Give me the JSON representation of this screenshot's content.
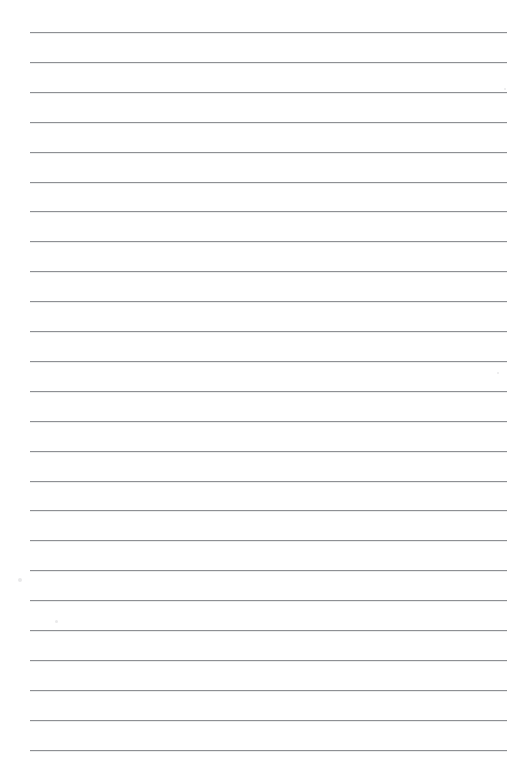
{
  "document": {
    "kind": "lined-paper-sheet",
    "title": "Blank ruled notebook page",
    "page_width_px": 513,
    "page_height_px": 757,
    "background_color": "#ffffff",
    "text_content": "",
    "header_text": "",
    "footer_text": "",
    "page_number": ""
  },
  "ruling": {
    "line_color": "#8e9094",
    "line_thickness_px": 1,
    "line_count": 25,
    "left_margin_px": 30,
    "right_edge_px": 507,
    "line_length_px": 477,
    "first_line_y_px": 32,
    "line_spacing_px": 29.9,
    "margin_rule": "none",
    "lines_y_px": [
      32,
      61.9,
      91.8,
      121.7,
      151.6,
      181.5,
      211.4,
      241.3,
      271.2,
      301.1,
      331,
      360.9,
      390.8,
      420.7,
      450.6,
      480.5,
      510.4,
      540.3,
      570.2,
      600.1,
      630,
      659.9,
      689.8,
      719.7,
      749.6
    ]
  },
  "artifacts": {
    "specks": [
      {
        "x_px": 18,
        "y_px": 578,
        "size_px": 4
      },
      {
        "x_px": 55,
        "y_px": 620,
        "size_px": 3
      },
      {
        "x_px": 504,
        "y_px": 88,
        "size_px": 2
      },
      {
        "x_px": 497,
        "y_px": 372,
        "size_px": 2
      }
    ]
  }
}
